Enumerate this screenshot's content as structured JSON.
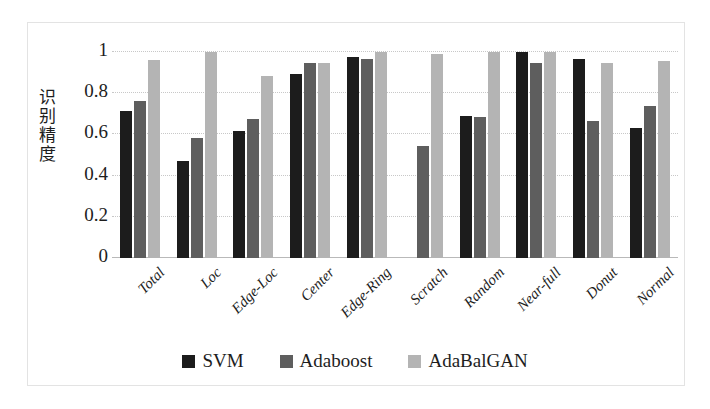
{
  "chart_data": {
    "type": "bar",
    "title": "",
    "xlabel": "",
    "ylabel": "识别精度",
    "ylim": [
      0,
      1
    ],
    "yticks": [
      "0",
      "0.2",
      "0.4",
      "0.6",
      "0.8",
      "1"
    ],
    "ytick_values": [
      0,
      0.2,
      0.4,
      0.6,
      0.8,
      1
    ],
    "grid": true,
    "legend_position": "bottom",
    "categories": [
      "Total",
      "Loc",
      "Edge-Loc",
      "Center",
      "Edge-Ring",
      "Scratch",
      "Random",
      "Near-full",
      "Donut",
      "Normal"
    ],
    "series": [
      {
        "name": "SVM",
        "color": "#1c1c1c",
        "values": [
          0.715,
          0.47,
          0.615,
          0.893,
          0.978,
          0.0,
          0.69,
          1.0,
          0.965,
          0.633
        ]
      },
      {
        "name": "Adaboost",
        "color": "#5e5e5e",
        "values": [
          0.763,
          0.585,
          0.675,
          0.945,
          0.968,
          0.545,
          0.685,
          0.945,
          0.665,
          0.738
        ]
      },
      {
        "name": "AdaBalGAN",
        "color": "#b4b4b4",
        "values": [
          0.963,
          0.998,
          0.885,
          0.945,
          0.998,
          0.99,
          0.998,
          0.998,
          0.948,
          0.958
        ]
      }
    ]
  },
  "legend": {
    "items": [
      {
        "label": "SVM",
        "color": "#1c1c1c"
      },
      {
        "label": "Adaboost",
        "color": "#5e5e5e"
      },
      {
        "label": "AdaBalGAN",
        "color": "#b4b4b4"
      }
    ]
  },
  "axis": {
    "y_label_chars": [
      "识",
      "别",
      "精",
      "度"
    ]
  }
}
